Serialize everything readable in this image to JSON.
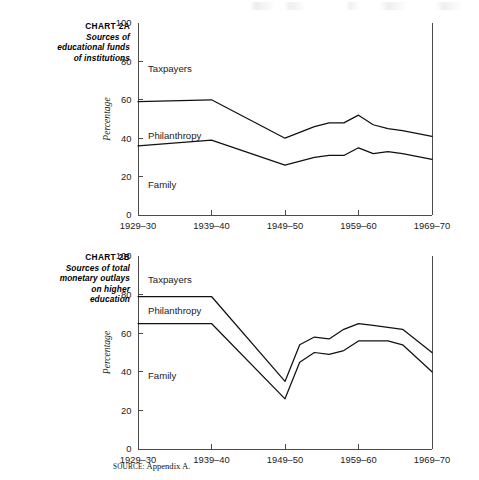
{
  "page": {
    "source_note_word": "SOURCE:",
    "source_note_text": "Appendix A."
  },
  "charts": [
    {
      "caption_id": "CHART 2A",
      "caption_lines": [
        "Sources of",
        "educational funds",
        "of institutions"
      ],
      "chart_data": {
        "type": "line",
        "title": "CHART 2A — Sources of educational funds of institutions",
        "xlabel": "",
        "ylabel": "Percentage",
        "ylim": [
          0,
          100
        ],
        "yticks": [
          0,
          20,
          40,
          60,
          80,
          100
        ],
        "xtick_labels": [
          "1929–30",
          "1939–40",
          "1949–50",
          "1959–60",
          "1969–70"
        ],
        "grid": false,
        "legend": "inline-labels",
        "annotations": [
          "Taxpayers",
          "Philanthropy",
          "Family"
        ],
        "x": [
          1929,
          1939,
          1949,
          1953,
          1955,
          1957,
          1959,
          1961,
          1963,
          1965,
          1969
        ],
        "series": [
          {
            "name": "upper-boundary",
            "label_above": "Taxpayers",
            "label_below": "Philanthropy",
            "values": [
              59,
              60,
              40,
              46,
              48,
              48,
              52,
              47,
              45,
              44,
              41
            ]
          },
          {
            "name": "lower-boundary",
            "label_above": "Philanthropy",
            "label_below": "Family",
            "values": [
              36,
              39,
              26,
              30,
              31,
              31,
              35,
              32,
              33,
              32,
              29
            ]
          }
        ]
      }
    },
    {
      "caption_id": "CHART 2B",
      "caption_lines": [
        "Sources of total",
        "monetary outlays",
        "on higher",
        "education"
      ],
      "chart_data": {
        "type": "line",
        "title": "CHART 2B — Sources of total monetary outlays on higher education",
        "xlabel": "",
        "ylabel": "Percentage",
        "ylim": [
          0,
          100
        ],
        "yticks": [
          0,
          20,
          40,
          60,
          80,
          100
        ],
        "xtick_labels": [
          "1929–30",
          "1939–40",
          "1949–50",
          "1959–60",
          "1969–70"
        ],
        "grid": false,
        "legend": "inline-labels",
        "annotations": [
          "Taxpayers",
          "Philanthropy",
          "Family"
        ],
        "x": [
          1929,
          1939,
          1949,
          1951,
          1953,
          1955,
          1957,
          1959,
          1961,
          1963,
          1965,
          1969
        ],
        "series": [
          {
            "name": "upper-boundary",
            "label_above": "Taxpayers",
            "label_below": "Philanthropy",
            "values": [
              79,
              79,
              35,
              54,
              58,
              57,
              62,
              65,
              64,
              63,
              62,
              50
            ]
          },
          {
            "name": "lower-boundary",
            "label_above": "Philanthropy",
            "label_below": "Family",
            "values": [
              65,
              65,
              26,
              45,
              50,
              49,
              51,
              56,
              56,
              56,
              54,
              40
            ]
          }
        ]
      }
    }
  ]
}
